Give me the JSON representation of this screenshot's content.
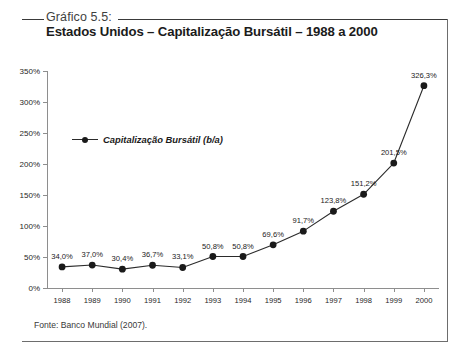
{
  "figure": {
    "caption": "Gráfico 5.5:",
    "title": "Estados Unidos – Capitalização Bursátil – 1988 a 2000",
    "source": "Fonte: Banco Mundial (2007)."
  },
  "chart_data": {
    "type": "line",
    "title": "Estados Unidos – Capitalização Bursátil – 1988 a 2000",
    "xlabel": "",
    "ylabel": "",
    "categories": [
      "1988",
      "1989",
      "1990",
      "1991",
      "1992",
      "1993",
      "1994",
      "1995",
      "1996",
      "1997",
      "1998",
      "1999",
      "2000"
    ],
    "values": [
      34.0,
      37.0,
      30.4,
      36.7,
      33.1,
      50.8,
      50.8,
      69.6,
      91.7,
      123.8,
      151.2,
      201.5,
      326.3
    ],
    "data_labels": [
      "34,0%",
      "37,0%",
      "30,4%",
      "36,7%",
      "33,1%",
      "50,8%",
      "50,8%",
      "69,6%",
      "91,7%",
      "123,8%",
      "151,2%",
      "201,5%",
      "326,3%"
    ],
    "series": [
      {
        "name": "Capitalização Bursátil (b/a)",
        "values": [
          34.0,
          37.0,
          30.4,
          36.7,
          33.1,
          50.8,
          50.8,
          69.6,
          91.7,
          123.8,
          151.2,
          201.5,
          326.3
        ]
      }
    ],
    "ylim": [
      0,
      350
    ],
    "ytick_labels": [
      "0%",
      "50%",
      "100%",
      "150%",
      "200%",
      "250%",
      "300%",
      "350%"
    ],
    "ytick_values": [
      0,
      50,
      100,
      150,
      200,
      250,
      300,
      350
    ],
    "grid": false,
    "legend": {
      "position": "inside-upper-left",
      "entries": [
        "Capitalização Bursátil (b/a)"
      ]
    },
    "line_color": "#2b2b2b",
    "marker_color": "#1a1a1a",
    "marker": "circle"
  }
}
